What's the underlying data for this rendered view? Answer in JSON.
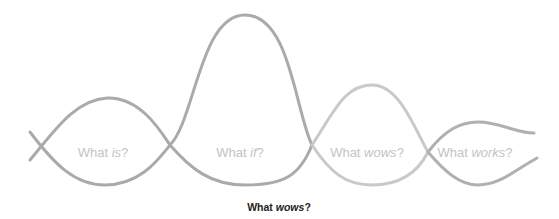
{
  "diagram": {
    "colors": {
      "curve": "#a8a8a8",
      "curve_light": "#c8c8c8",
      "label": "#c4c4c4",
      "caption": "#222222",
      "background": "#ffffff"
    },
    "phases": [
      {
        "prefix": "What ",
        "emphasis": "is",
        "suffix": "?"
      },
      {
        "prefix": "What ",
        "emphasis": "if",
        "suffix": "?"
      },
      {
        "prefix": "What ",
        "emphasis": "wows",
        "suffix": "?"
      },
      {
        "prefix": "What ",
        "emphasis": "works",
        "suffix": "?"
      }
    ],
    "caption": {
      "prefix": "What ",
      "emphasis": "wows",
      "suffix": "?"
    }
  }
}
